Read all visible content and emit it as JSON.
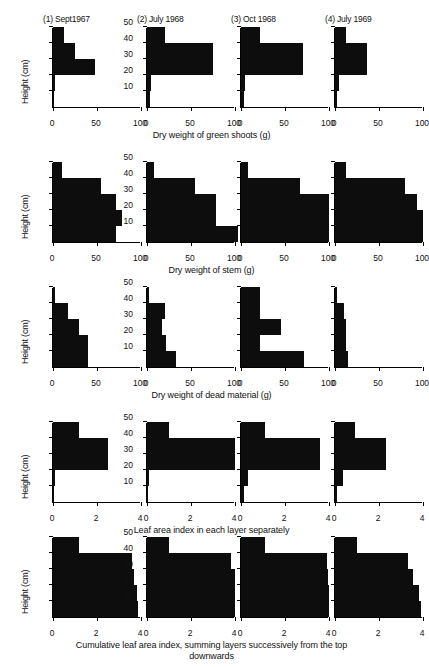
{
  "figure": {
    "y_axis_label": "Height (cm)",
    "y_ticks": [
      10,
      20,
      30,
      40,
      50
    ],
    "panel_titles": [
      "(1) Sept1967",
      "(2) July 1968",
      "(3) Oct 1968",
      "(4) July 1969"
    ],
    "layers": [
      "0-10",
      "10-20",
      "20-30",
      "30-40",
      "40-50"
    ],
    "bottom_caption_line1": "Cumulative leaf area index, summing layers successively from the top",
    "bottom_caption_line2": "downwards"
  },
  "chart_data": [
    {
      "type": "bar",
      "orientation": "horizontal",
      "title": "Dry weight of green shoots (g)",
      "xlabel": "Dry weight of green shoots (g)",
      "ylabel": "Height (cm)",
      "xlim": [
        0,
        100
      ],
      "ylim": [
        0,
        50
      ],
      "xticks": [
        0,
        50,
        100
      ],
      "xtick_labels": [
        "0",
        "50",
        "100"
      ],
      "yticks": [
        10,
        20,
        30,
        40,
        50
      ],
      "grid": false,
      "categories": [
        "0-10",
        "10-20",
        "20-30",
        "30-40",
        "40-50"
      ],
      "series": [
        {
          "name": "(1) Sept1967",
          "values": [
            1,
            2,
            48,
            25,
            12
          ]
        },
        {
          "name": "(2) July 1968",
          "values": [
            3,
            5,
            75,
            75,
            20
          ]
        },
        {
          "name": "(3) Oct 1968",
          "values": [
            3,
            5,
            70,
            70,
            22
          ]
        },
        {
          "name": "(4) July 1969",
          "values": [
            2,
            5,
            36,
            36,
            13
          ]
        }
      ]
    },
    {
      "type": "bar",
      "orientation": "horizontal",
      "title": "Dry weight of stem (g)",
      "xlabel": "Dry weight of stem (g)",
      "ylabel": "Height (cm)",
      "xlim": [
        0,
        100
      ],
      "ylim": [
        0,
        50
      ],
      "xticks": [
        0,
        50,
        100
      ],
      "xtick_labels": [
        "0",
        "50",
        "100"
      ],
      "yticks": [
        10,
        20,
        30,
        40,
        50
      ],
      "grid": false,
      "categories": [
        "0-10",
        "10-20",
        "20-30",
        "30-40",
        "40-50"
      ],
      "series": [
        {
          "name": "(1) Sept1967",
          "values": [
            72,
            78,
            72,
            55,
            10
          ]
        },
        {
          "name": "(2) July 1968",
          "values": [
            103,
            78,
            78,
            55,
            8
          ]
        },
        {
          "name": "(3) Oct 1968",
          "values": [
            100,
            100,
            100,
            67,
            8
          ]
        },
        {
          "name": "(4) July 1969",
          "values": [
            100,
            100,
            93,
            80,
            12
          ]
        }
      ]
    },
    {
      "type": "bar",
      "orientation": "horizontal",
      "title": "Dry weight of dead material (g)",
      "xlabel": "Dry weight of dead material (g)",
      "ylabel": "Height (cm)",
      "xlim": [
        0,
        100
      ],
      "ylim": [
        0,
        50
      ],
      "xticks": [
        0,
        50,
        100
      ],
      "xtick_labels": [
        "0",
        "50",
        "100"
      ],
      "yticks": [
        10,
        20,
        30,
        40,
        50
      ],
      "grid": false,
      "categories": [
        "0-10",
        "10-20",
        "20-30",
        "30-40",
        "40-50"
      ],
      "series": [
        {
          "name": "(1) Sept1967",
          "values": [
            40,
            40,
            30,
            17,
            2
          ]
        },
        {
          "name": "(2) July 1968",
          "values": [
            33,
            22,
            17,
            20,
            2
          ]
        },
        {
          "name": "(3) Oct 1968",
          "values": [
            72,
            22,
            45,
            22,
            22
          ]
        },
        {
          "name": "(4) July 1969",
          "values": [
            15,
            12,
            12,
            10,
            2
          ]
        }
      ]
    },
    {
      "type": "bar",
      "orientation": "horizontal",
      "title": "Leaf area index in each layer separately",
      "xlabel": "Leaf area index in each layer separately",
      "ylabel": "Height (cm)",
      "xlim": [
        0,
        4
      ],
      "ylim": [
        0,
        50
      ],
      "xticks": [
        0,
        2,
        4
      ],
      "xtick_labels": [
        "0",
        "2",
        "4"
      ],
      "yticks": [
        10,
        20,
        30,
        40,
        50
      ],
      "grid": false,
      "categories": [
        "0-10",
        "10-20",
        "20-30",
        "30-40",
        "40-50"
      ],
      "series": [
        {
          "name": "(1) Sept1967",
          "values": [
            0.05,
            0.08,
            2.5,
            2.5,
            1.2
          ]
        },
        {
          "name": "(2) July 1968",
          "values": [
            0.05,
            0.1,
            4.0,
            4.0,
            1.0
          ]
        },
        {
          "name": "(3) Oct 1968",
          "values": [
            0.15,
            0.3,
            3.6,
            3.6,
            1.1
          ]
        },
        {
          "name": "(4) July 1969",
          "values": [
            0.1,
            0.35,
            2.3,
            2.3,
            0.9
          ]
        }
      ]
    },
    {
      "type": "bar",
      "orientation": "horizontal",
      "title": "Cumulative leaf area index, summing layers successively from the top downwards",
      "xlabel": "Cumulative leaf area index, summing layers successively from the top downwards",
      "ylabel": "Height (cm)",
      "xlim": [
        0,
        4
      ],
      "ylim": [
        0,
        50
      ],
      "xticks": [
        0,
        2,
        4
      ],
      "xtick_labels": [
        "0",
        "2",
        "4"
      ],
      "yticks": [
        10,
        20,
        30,
        40,
        50
      ],
      "grid": false,
      "categories": [
        "0-10",
        "10-20",
        "20-30",
        "30-40",
        "40-50"
      ],
      "series": [
        {
          "name": "(1) Sept1967",
          "values": [
            3.85,
            3.8,
            3.7,
            3.6,
            1.2
          ]
        },
        {
          "name": "(2) July 1968",
          "values": [
            4.0,
            4.0,
            4.0,
            3.8,
            1.0
          ]
        },
        {
          "name": "(3) Oct 1968",
          "values": [
            4.0,
            4.0,
            3.95,
            3.9,
            1.1
          ]
        },
        {
          "name": "(4) July 1969",
          "values": [
            3.9,
            3.8,
            3.55,
            3.3,
            1.0
          ]
        }
      ]
    }
  ]
}
